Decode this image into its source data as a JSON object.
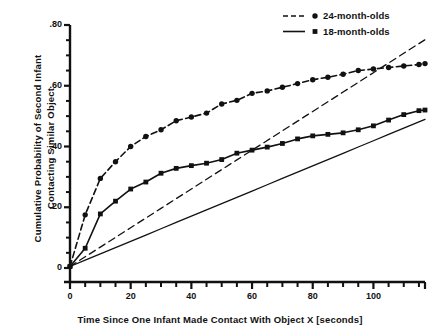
{
  "chart_data": {
    "type": "line",
    "title": "",
    "xlabel": "Time Since One Infant Made Contact With Object X  [seconds]",
    "ylabel": "Cumulative Probability of Second Infant Contacting Similar Object",
    "ylabel_line1": "Cumulative Probability of Second Infant",
    "ylabel_line2": "Contacting Similar Object",
    "xlim": [
      0,
      117
    ],
    "ylim": [
      0,
      0.8
    ],
    "grid": false,
    "legend_position": "top-right",
    "xticks": [
      0,
      20,
      40,
      60,
      80,
      100
    ],
    "xtick_labels": [
      "0",
      "20",
      "40",
      "60",
      "80",
      "100"
    ],
    "xminor_step": 5,
    "yticks": [
      0,
      0.2,
      0.4,
      0.6,
      0.8
    ],
    "ytick_labels": [
      "0",
      ".20",
      ".40",
      ".60",
      ".80"
    ],
    "yminor_step": 0.05,
    "x": [
      0,
      5,
      10,
      15,
      20,
      25,
      30,
      35,
      40,
      45,
      50,
      55,
      60,
      65,
      70,
      75,
      80,
      85,
      90,
      95,
      100,
      105,
      110,
      115,
      117
    ],
    "series": [
      {
        "name": "24-month-olds",
        "style": "dashed",
        "marker": "circle",
        "values": [
          0.005,
          0.175,
          0.295,
          0.35,
          0.4,
          0.433,
          0.455,
          0.485,
          0.497,
          0.51,
          0.54,
          0.552,
          0.575,
          0.583,
          0.595,
          0.607,
          0.62,
          0.628,
          0.638,
          0.65,
          0.655,
          0.66,
          0.665,
          0.67,
          0.673
        ]
      },
      {
        "name": "18-month-olds",
        "style": "solid",
        "marker": "square",
        "values": [
          0.005,
          0.065,
          0.178,
          0.22,
          0.26,
          0.283,
          0.312,
          0.328,
          0.337,
          0.345,
          0.357,
          0.378,
          0.388,
          0.398,
          0.41,
          0.425,
          0.435,
          0.44,
          0.445,
          0.455,
          0.468,
          0.487,
          0.505,
          0.518,
          0.52
        ]
      },
      {
        "name": "24-month-olds-baseline",
        "style": "dashed",
        "marker": "none",
        "is_reference_line": true,
        "values": [
          0.005,
          0.0369,
          0.0688,
          0.1007,
          0.1326,
          0.1645,
          0.1964,
          0.2283,
          0.2602,
          0.2921,
          0.324,
          0.3559,
          0.3878,
          0.4197,
          0.4516,
          0.4835,
          0.5154,
          0.5473,
          0.5792,
          0.6111,
          0.643,
          0.6749,
          0.7068,
          0.7387,
          0.7515
        ]
      },
      {
        "name": "18-month-olds-baseline",
        "style": "solid",
        "marker": "none",
        "is_reference_line": true,
        "values": [
          0.005,
          0.0257,
          0.0464,
          0.0671,
          0.0878,
          0.1085,
          0.1292,
          0.1499,
          0.1706,
          0.1913,
          0.212,
          0.2327,
          0.2534,
          0.2741,
          0.2948,
          0.3155,
          0.3362,
          0.3569,
          0.3776,
          0.3983,
          0.419,
          0.4397,
          0.4604,
          0.4811,
          0.4894
        ]
      }
    ],
    "legend": [
      {
        "label": "24-month-olds",
        "style": "dashed",
        "marker": "circle"
      },
      {
        "label": "18-month-olds",
        "style": "solid",
        "marker": "square"
      }
    ],
    "colors": {
      "ink": "#111111",
      "background": "#ffffff"
    }
  }
}
